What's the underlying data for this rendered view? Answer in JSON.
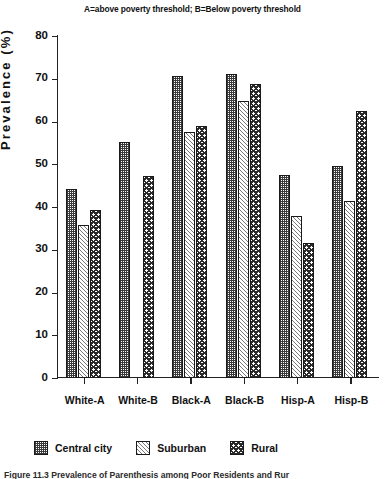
{
  "chart_data": {
    "type": "bar",
    "title": "A=above poverty threshold; B=Below poverty threshold",
    "xlabel": "",
    "ylabel": "Prevalence (%)",
    "ylim": [
      0,
      80
    ],
    "ytick_step": 10,
    "yticks": [
      80,
      70,
      60,
      50,
      40,
      30,
      20,
      10,
      0
    ],
    "grid": false,
    "legend_position": "bottom",
    "categories": [
      "White-A",
      "White-B",
      "Black-A",
      "Black-B",
      "Hisp-A",
      "Hisp-B"
    ],
    "series": [
      {
        "name": "Central city",
        "pattern": "checker-fine",
        "values": [
          44.2,
          55.3,
          70.6,
          71.0,
          47.6,
          49.5
        ]
      },
      {
        "name": "Suburban",
        "pattern": "diagonal-hatch",
        "values": [
          35.8,
          null,
          57.5,
          64.8,
          38.0,
          41.5
        ]
      },
      {
        "name": "Rural",
        "pattern": "checker-coarse",
        "values": [
          39.3,
          47.2,
          59.0,
          68.8,
          31.5,
          62.5
        ]
      }
    ]
  },
  "legend": {
    "items": [
      {
        "label": "Central city",
        "pattern": "checker-fine"
      },
      {
        "label": "Suburban",
        "pattern": "diagonal-hatch"
      },
      {
        "label": "Rural",
        "pattern": "checker-coarse"
      }
    ]
  },
  "caption": "Figure 11.3 Prevalence of Parenthesis among Poor Residents and Rur"
}
